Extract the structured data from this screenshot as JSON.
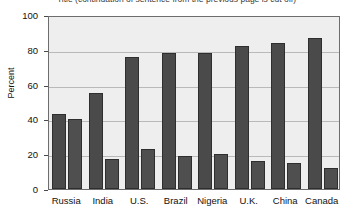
{
  "chart_data": {
    "type": "bar",
    "title": "Title (continuation of sentence from the previous page is cut off)",
    "xlabel": "",
    "ylabel": "Percent",
    "ylim": [
      0,
      100
    ],
    "yticks": [
      0,
      20,
      40,
      60,
      80,
      100
    ],
    "grid": true,
    "legend": "none",
    "categories": [
      "Russia",
      "India",
      "U.S.",
      "Brazil",
      "Nigeria",
      "U.K.",
      "China",
      "Canada"
    ],
    "series": [
      {
        "name": "Series 1",
        "values": [
          43,
          55,
          76,
          78,
          78,
          82,
          84,
          87
        ]
      },
      {
        "name": "Series 2",
        "values": [
          40,
          17,
          23,
          19,
          20,
          16,
          15,
          12
        ]
      }
    ],
    "colors": {
      "series1": "#4a4a4a",
      "series2": "#4f4f4f",
      "plot_background": "#eeeeee",
      "gridline": "#b9b9b9",
      "axis": "#6d6d6d"
    }
  }
}
